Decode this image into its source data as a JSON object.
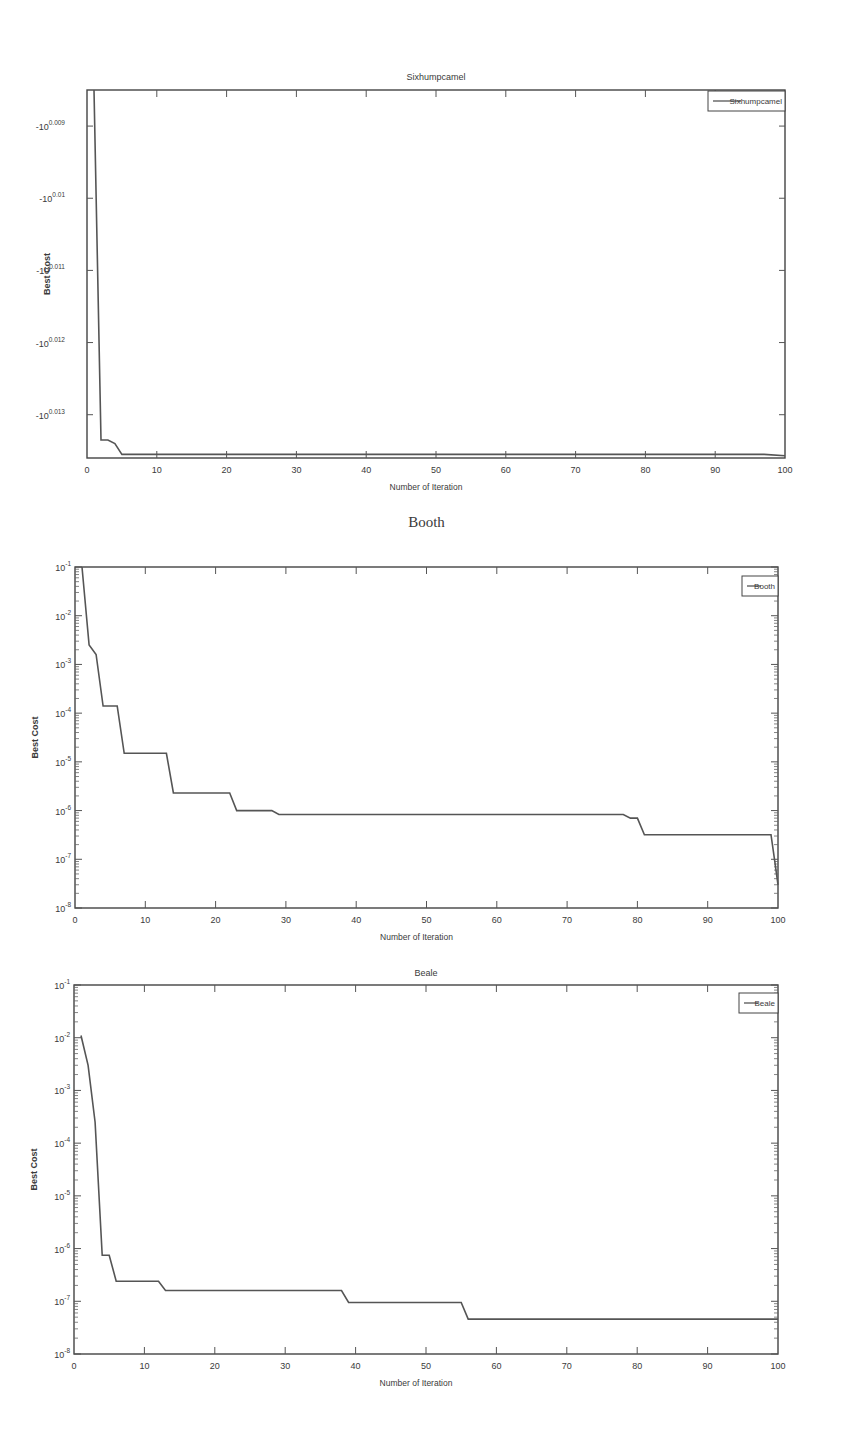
{
  "chart_data": [
    {
      "type": "line",
      "title": "Sixhumpcamel",
      "xlabel": "Number of Iteration",
      "ylabel": "Best Cost",
      "xlim": [
        0,
        100
      ],
      "x_ticks": [
        "0",
        "10",
        "20",
        "30",
        "40",
        "50",
        "60",
        "70",
        "80",
        "90",
        "100"
      ],
      "y_scale": "log (negative values)",
      "y_ticks": [
        "-10^0.009",
        "-10^0.01",
        "-10^0.011",
        "-10^0.012",
        "-10^0.013"
      ],
      "ylim_exponent": [
        0.0085,
        0.0136
      ],
      "legend": [
        "Sixhumpcamel"
      ],
      "legend_position": "upper right",
      "grid": false,
      "series": [
        {
          "name": "Sixhumpcamel",
          "x": [
            1,
            2,
            3,
            4,
            5,
            10,
            50,
            97,
            100
          ],
          "exponent": [
            0.0085,
            0.01335,
            0.01335,
            0.0134,
            0.01355,
            0.01355,
            0.01355,
            0.01355,
            0.01357
          ]
        }
      ]
    },
    {
      "type": "line",
      "title": "Booth",
      "xlabel": "Number of Iteration",
      "ylabel": "Best Cost",
      "xlim": [
        0,
        100
      ],
      "x_ticks": [
        "0",
        "10",
        "20",
        "30",
        "40",
        "50",
        "60",
        "70",
        "80",
        "90",
        "100"
      ],
      "y_scale": "log",
      "y_ticks": [
        "10^-1",
        "10^-2",
        "10^-3",
        "10^-4",
        "10^-5",
        "10^-6",
        "10^-7",
        "10^-8"
      ],
      "ylim": [
        1e-08,
        0.1
      ],
      "legend": [
        "Booth"
      ],
      "legend_position": "upper right",
      "grid": false,
      "series": [
        {
          "name": "Booth",
          "x": [
            1,
            2,
            3,
            4,
            6,
            7,
            13,
            14,
            22,
            23,
            28,
            29,
            78,
            79,
            80,
            81,
            99,
            99.5,
            100
          ],
          "y": [
            0.1,
            0.0025,
            0.0016,
            0.00014,
            0.00014,
            1.5e-05,
            1.5e-05,
            2.3e-06,
            2.3e-06,
            1e-06,
            1e-06,
            8.3e-07,
            8.3e-07,
            7e-07,
            7e-07,
            3.2e-07,
            3.2e-07,
            1e-07,
            3e-08
          ]
        }
      ]
    },
    {
      "type": "line",
      "title": "Beale",
      "xlabel": "Number of Iteration",
      "ylabel": "Best Cost",
      "xlim": [
        0,
        100
      ],
      "x_ticks": [
        "0",
        "10",
        "20",
        "30",
        "40",
        "50",
        "60",
        "70",
        "80",
        "90",
        "100"
      ],
      "y_scale": "log",
      "y_ticks": [
        "10^-1",
        "10^-2",
        "10^-3",
        "10^-4",
        "10^-5",
        "10^-6",
        "10^-7",
        "10^-8"
      ],
      "ylim": [
        1e-08,
        0.1
      ],
      "legend": [
        "Beale"
      ],
      "legend_position": "upper right",
      "grid": false,
      "series": [
        {
          "name": "Beale",
          "x": [
            1,
            2,
            3,
            4,
            5,
            6,
            12,
            13,
            38,
            39,
            55,
            56,
            100
          ],
          "y": [
            0.011,
            0.003,
            0.00025,
            7.5e-07,
            7.5e-07,
            2.4e-07,
            2.4e-07,
            1.6e-07,
            1.6e-07,
            9.5e-08,
            9.5e-08,
            4.6e-08,
            4.6e-08
          ]
        }
      ]
    }
  ]
}
